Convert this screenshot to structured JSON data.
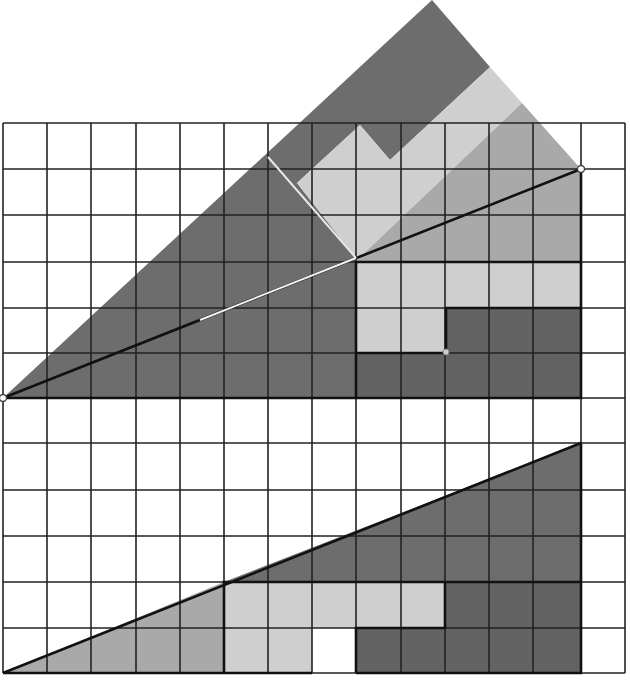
{
  "diagram": {
    "grid": {
      "columns": 14,
      "rows_top": 6,
      "rows_bottom": 6,
      "x_lines": [
        3,
        47,
        91,
        136,
        180,
        224,
        268,
        312,
        356,
        401,
        445,
        489,
        533,
        581,
        625
      ],
      "y_lines_top": [
        123,
        169,
        215,
        262,
        308,
        353,
        398
      ],
      "y_lines_bottom": [
        398,
        443,
        490,
        536,
        582,
        628,
        673
      ],
      "line_color": "#222222"
    },
    "colors": {
      "dark": "#6d6d6d",
      "darker": "#636363",
      "mid": "#a9a9a9",
      "light": "#cfcfcf",
      "white": "#ffffff"
    },
    "top_figure": {
      "description": "Triangle 13x5 with rearranged pieces rotated above it",
      "triangle_vertices": [
        [
          3,
          398
        ],
        [
          581,
          169
        ],
        [
          581,
          398
        ]
      ],
      "pieces": [
        {
          "name": "dark-band",
          "color": "dark"
        },
        {
          "name": "light-band",
          "color": "light"
        },
        {
          "name": "mid-grey-triangle",
          "color": "mid"
        },
        {
          "name": "light-block",
          "color": "light"
        },
        {
          "name": "dark-block",
          "color": "darker"
        }
      ],
      "marker_points": [
        [
          3,
          398
        ],
        [
          581,
          169
        ],
        [
          446,
          352
        ]
      ]
    },
    "bottom_figure": {
      "description": "Same triangle re-arranged with one missing (white) square",
      "triangle_vertices": [
        [
          3,
          673
        ],
        [
          581,
          443
        ],
        [
          581,
          673
        ]
      ],
      "missing_square": {
        "col": 7,
        "row": 5
      },
      "pieces": [
        {
          "name": "mid-grey-triangle",
          "color": "mid"
        },
        {
          "name": "dark-triangle",
          "color": "dark"
        },
        {
          "name": "light-block",
          "color": "light"
        },
        {
          "name": "dark-block",
          "color": "darker"
        }
      ]
    }
  }
}
